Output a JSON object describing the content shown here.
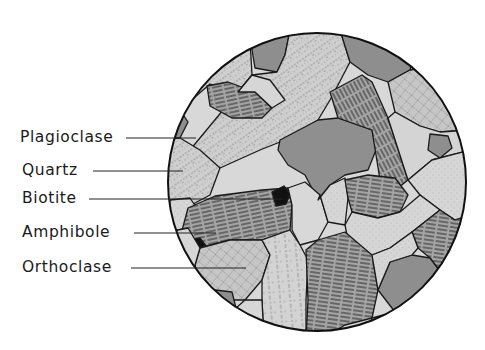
{
  "diagram": {
    "type": "thin-section-illustration",
    "colors": {
      "background": "#ffffff",
      "outline": "#1a1a1a",
      "grain_dark": "#8e8e8e",
      "grain_mid": "#acacac",
      "grain_light": "#cdcdcd",
      "grain_lightest": "#dedede",
      "biotite": "#111111"
    },
    "field_of_view": {
      "cx": 317,
      "cy": 182,
      "r": 149
    },
    "labels": [
      {
        "id": "plagioclase",
        "text": "Plagioclase",
        "x": 20,
        "y": 130,
        "line": [
          126,
          138,
          196,
          138
        ]
      },
      {
        "id": "quartz",
        "text": "Quartz",
        "x": 22,
        "y": 163,
        "line": [
          93,
          171,
          183,
          171
        ]
      },
      {
        "id": "biotite",
        "text": "Biotite",
        "x": 22,
        "y": 191,
        "line": [
          89,
          199,
          282,
          199
        ]
      },
      {
        "id": "amphibole",
        "text": "Amphibole",
        "x": 22,
        "y": 225,
        "line": [
          134,
          233,
          216,
          233
        ]
      },
      {
        "id": "orthoclase",
        "text": "Orthoclase",
        "x": 22,
        "y": 260,
        "line": [
          131,
          268,
          246,
          268
        ]
      }
    ]
  }
}
